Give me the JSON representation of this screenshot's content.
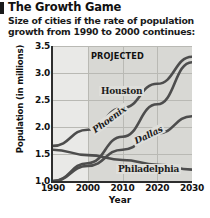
{
  "header": {
    "title": "The Growth Game",
    "subtitle": "Size of cities if the rate of population growth from 1990 to 2000 continues:"
  },
  "chart_data": {
    "type": "line",
    "title": "The Growth Game",
    "subtitle": "Size of cities if the rate of population growth from 1990 to 2000 continues:",
    "xlabel": "Year",
    "ylabel": "Population (in millions)",
    "x": [
      1990,
      2000,
      2010,
      2020,
      2030
    ],
    "xlim": [
      1990,
      2030
    ],
    "ylim": [
      1.0,
      3.5
    ],
    "yticks": [
      "1.0",
      "1.5",
      "2.0",
      "2.5",
      "3.0",
      "3.5"
    ],
    "ytick_values": [
      1.0,
      1.5,
      2.0,
      2.5,
      3.0,
      3.5
    ],
    "xticks": [
      "1990",
      "2000",
      "2010",
      "2020",
      "2030"
    ],
    "grid": true,
    "legend": "inline-labels",
    "annotations": [
      {
        "text": "PROJECTED",
        "x": 2010,
        "note": "shaded band covering 2000-2030"
      }
    ],
    "shaded_region": {
      "label": "PROJECTED",
      "from": 2000,
      "to": 2030
    },
    "series": [
      {
        "name": "Houston",
        "values": [
          1.65,
          1.95,
          2.35,
          2.8,
          3.3
        ]
      },
      {
        "name": "Phoenix",
        "values": [
          1.0,
          1.33,
          1.82,
          2.42,
          3.2
        ]
      },
      {
        "name": "Dallas",
        "values": [
          1.0,
          1.28,
          1.58,
          1.88,
          2.2
        ]
      },
      {
        "name": "Philadelphia",
        "values": [
          1.58,
          1.48,
          1.39,
          1.3,
          1.21
        ]
      }
    ]
  }
}
